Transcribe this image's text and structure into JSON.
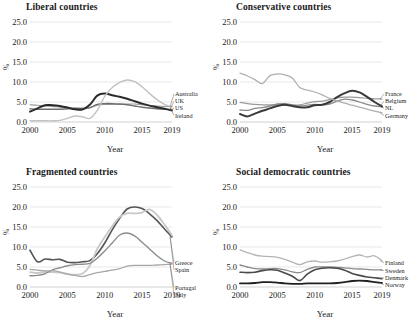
{
  "figure": {
    "ylabel": "%",
    "xlabel": "Year",
    "y_ticks": [
      "0.0",
      "5.0",
      "10.0",
      "15.0",
      "20.0",
      "25.0"
    ],
    "x_ticks": [
      "2000",
      "2005",
      "2010",
      "2015",
      "2019"
    ]
  },
  "chart_data": [
    {
      "type": "line",
      "title": "Liberal countries",
      "xlabel": "Year",
      "ylabel": "%",
      "ylim": [
        0,
        25
      ],
      "xlim": [
        2000,
        2019
      ],
      "grid": true,
      "legend_position": "right-inline",
      "x": [
        2000,
        2001,
        2002,
        2003,
        2004,
        2005,
        2006,
        2007,
        2008,
        2009,
        2010,
        2011,
        2012,
        2013,
        2014,
        2015,
        2016,
        2017,
        2018,
        2019
      ],
      "series": [
        {
          "name": "Australia",
          "color": "#9a9a9a",
          "width": 1.1,
          "values": [
            4.3,
            4.2,
            4.0,
            3.9,
            3.7,
            3.6,
            3.5,
            3.4,
            3.5,
            4.2,
            4.4,
            4.4,
            4.4,
            4.5,
            4.5,
            4.3,
            4.1,
            4.0,
            3.9,
            3.8
          ]
        },
        {
          "name": "UK",
          "color": "#6e6e6e",
          "width": 1.4,
          "values": [
            3.3,
            3.2,
            3.2,
            3.2,
            3.2,
            3.3,
            3.4,
            3.4,
            3.6,
            4.4,
            4.6,
            4.6,
            4.5,
            4.3,
            4.0,
            3.7,
            3.5,
            3.3,
            3.2,
            3.1
          ]
        },
        {
          "name": "US",
          "color": "#2b2b2b",
          "width": 2.0,
          "values": [
            2.6,
            3.4,
            4.2,
            4.2,
            4.0,
            3.6,
            3.2,
            3.1,
            4.3,
            6.6,
            7.1,
            6.7,
            6.3,
            5.8,
            5.2,
            4.6,
            4.1,
            3.7,
            3.3,
            2.9
          ]
        },
        {
          "name": "Ireland",
          "color": "#c2c2c2",
          "width": 1.4,
          "values": [
            0.3,
            0.3,
            0.3,
            0.3,
            0.4,
            0.9,
            1.5,
            1.3,
            0.9,
            2.9,
            6.4,
            8.6,
            9.9,
            10.5,
            10.1,
            8.8,
            7.1,
            5.6,
            4.4,
            3.8
          ]
        }
      ]
    },
    {
      "type": "line",
      "title": "Conservative countries",
      "xlabel": "Year",
      "ylabel": "%",
      "ylim": [
        0,
        25
      ],
      "xlim": [
        2000,
        2019
      ],
      "grid": true,
      "legend_position": "right-inline",
      "x": [
        2000,
        2001,
        2002,
        2003,
        2004,
        2005,
        2006,
        2007,
        2008,
        2009,
        2010,
        2011,
        2012,
        2013,
        2014,
        2015,
        2016,
        2017,
        2018,
        2019
      ],
      "series": [
        {
          "name": "France",
          "color": "#9a9a9a",
          "width": 1.2,
          "values": [
            4.9,
            4.6,
            4.4,
            4.3,
            4.3,
            4.3,
            4.2,
            4.2,
            4.3,
            4.7,
            5.1,
            5.2,
            5.6,
            6.0,
            6.2,
            6.2,
            6.1,
            5.9,
            5.8,
            5.7
          ]
        },
        {
          "name": "Belgium",
          "color": "#8a8a8a",
          "width": 1.3,
          "values": [
            3.0,
            2.9,
            3.4,
            3.6,
            4.0,
            4.5,
            4.6,
            4.3,
            4.0,
            4.2,
            4.4,
            4.3,
            4.5,
            5.2,
            5.7,
            5.5,
            5.0,
            4.4,
            4.0,
            3.8
          ]
        },
        {
          "name": "NL",
          "color": "#3a3a3a",
          "width": 2.0,
          "values": [
            2.0,
            1.4,
            2.1,
            2.8,
            3.4,
            4.0,
            4.3,
            4.0,
            3.7,
            3.7,
            4.2,
            4.3,
            5.0,
            6.2,
            7.2,
            7.8,
            7.4,
            6.3,
            5.0,
            3.9
          ]
        },
        {
          "name": "Germany",
          "color": "#b0b0b0",
          "width": 1.3,
          "values": [
            12.2,
            11.5,
            10.6,
            9.6,
            11.6,
            12.0,
            11.8,
            11.0,
            8.6,
            8.0,
            7.5,
            6.8,
            5.9,
            5.3,
            4.7,
            4.2,
            3.7,
            3.2,
            2.7,
            2.3
          ]
        }
      ]
    },
    {
      "type": "line",
      "title": "Fragmented countries",
      "xlabel": "Year",
      "ylabel": "%",
      "ylim": [
        0,
        25
      ],
      "xlim": [
        2000,
        2019
      ],
      "grid": true,
      "legend_position": "right-inline",
      "x": [
        2000,
        2001,
        2002,
        2003,
        2004,
        2005,
        2006,
        2007,
        2008,
        2009,
        2010,
        2011,
        2012,
        2013,
        2014,
        2015,
        2016,
        2017,
        2018,
        2019
      ],
      "series": [
        {
          "name": "Greece",
          "color": "#555555",
          "width": 1.6,
          "values": [
            9.2,
            6.3,
            7.0,
            6.8,
            6.9,
            6.2,
            6.1,
            6.3,
            6.6,
            8.3,
            11.0,
            14.3,
            17.2,
            19.5,
            20.0,
            19.6,
            18.3,
            16.6,
            14.5,
            12.5
          ]
        },
        {
          "name": "Spain",
          "color": "#c9c9c9",
          "width": 1.8,
          "values": [
            3.7,
            3.5,
            3.7,
            3.7,
            3.6,
            3.3,
            3.1,
            3.3,
            5.3,
            9.5,
            12.5,
            15.2,
            17.5,
            18.4,
            18.4,
            18.6,
            19.4,
            18.0,
            15.6,
            12.9
          ]
        },
        {
          "name": "Portugal",
          "color": "#8c8c8c",
          "width": 1.4,
          "values": [
            2.8,
            2.9,
            3.3,
            4.3,
            4.8,
            5.3,
            5.6,
            5.7,
            5.9,
            7.2,
            9.0,
            11.0,
            13.0,
            13.5,
            12.8,
            11.2,
            9.5,
            7.8,
            6.5,
            5.9
          ]
        },
        {
          "name": "Italy",
          "color": "#a8a8a8",
          "width": 1.3,
          "values": [
            4.4,
            4.2,
            4.0,
            4.1,
            3.7,
            3.2,
            2.9,
            2.6,
            3.1,
            3.6,
            3.9,
            4.2,
            4.6,
            5.2,
            5.4,
            5.4,
            5.4,
            5.5,
            5.6,
            5.7
          ]
        }
      ]
    },
    {
      "type": "line",
      "title": "Social democratic countries",
      "xlabel": "Year",
      "ylabel": "%",
      "ylim": [
        0,
        25
      ],
      "xlim": [
        2000,
        2019
      ],
      "grid": true,
      "legend_position": "right-inline",
      "x": [
        2000,
        2001,
        2002,
        2003,
        2004,
        2005,
        2006,
        2007,
        2008,
        2009,
        2010,
        2011,
        2012,
        2013,
        2014,
        2015,
        2016,
        2017,
        2018,
        2019
      ],
      "series": [
        {
          "name": "Finland",
          "color": "#b5b5b5",
          "width": 1.3,
          "values": [
            9.3,
            8.6,
            8.0,
            7.7,
            7.6,
            7.4,
            6.9,
            6.2,
            5.6,
            6.3,
            6.5,
            6.2,
            6.3,
            6.5,
            7.0,
            7.6,
            8.0,
            7.5,
            7.8,
            6.6
          ]
        },
        {
          "name": "Sweden",
          "color": "#8a8a8a",
          "width": 1.3,
          "values": [
            5.5,
            5.0,
            4.6,
            4.5,
            4.6,
            4.6,
            4.3,
            3.8,
            3.6,
            4.4,
            5.0,
            5.0,
            5.0,
            4.9,
            4.8,
            4.6,
            4.5,
            4.4,
            4.3,
            4.3
          ]
        },
        {
          "name": "Denmark",
          "color": "#4a4a4a",
          "width": 1.6,
          "values": [
            3.7,
            3.6,
            3.7,
            4.1,
            4.3,
            4.2,
            3.5,
            2.7,
            1.6,
            3.2,
            4.3,
            4.7,
            4.8,
            4.7,
            4.2,
            3.4,
            2.9,
            2.5,
            2.3,
            2.1
          ]
        },
        {
          "name": "Norway",
          "color": "#202020",
          "width": 1.8,
          "values": [
            0.9,
            0.9,
            1.0,
            1.2,
            1.2,
            1.1,
            0.9,
            0.8,
            0.8,
            0.9,
            0.9,
            0.9,
            0.9,
            1.0,
            1.2,
            1.5,
            1.6,
            1.5,
            1.2,
            1.0
          ]
        }
      ]
    }
  ]
}
